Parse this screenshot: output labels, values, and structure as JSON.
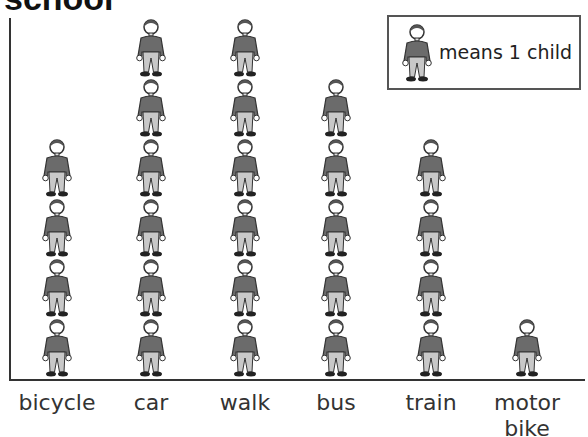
{
  "title": "school",
  "legend": {
    "text": "means 1 child",
    "icon": "child-figure-icon"
  },
  "colors": {
    "shirt": "#6b6b6b",
    "trousers": "#c8c8c8",
    "shoes": "#222222",
    "outline": "#333333",
    "axis": "#333333"
  },
  "chart_data": {
    "type": "pictogram",
    "title": "school",
    "categories": [
      "bicycle",
      "car",
      "walk",
      "bus",
      "train",
      "motor bike"
    ],
    "values": [
      4,
      6,
      6,
      5,
      4,
      1
    ],
    "unit": "1 figure = 1 child",
    "xlabel": "",
    "ylabel": "",
    "legend_position": "top-right",
    "grid": false
  },
  "labels": [
    "bicycle",
    "car",
    "walk",
    "bus",
    "train",
    "motor\nbike"
  ]
}
